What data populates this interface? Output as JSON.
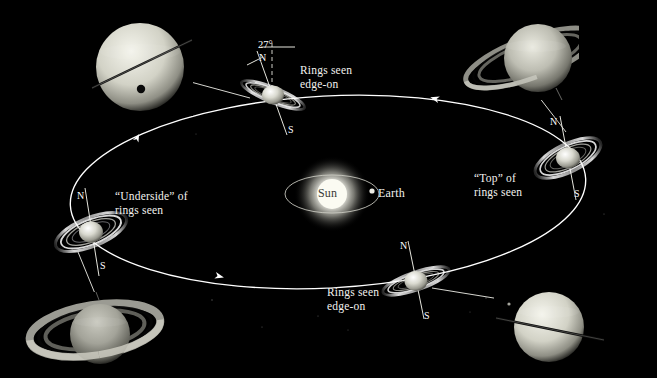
{
  "figure": {
    "background_color": "#000000",
    "line_color": "#f0f0ea",
    "text_color": "#f2f2ef",
    "width": 657,
    "height": 378
  },
  "center": {
    "sun_label": "Sun",
    "earth_label": "Earth",
    "sun_color": "#f5f5ef",
    "earth_color": "#e8e8e2"
  },
  "tilt": {
    "value": "27",
    "degree_symbol": "°",
    "display": "27°"
  },
  "orbit": {
    "direction_arrows": 3,
    "ellipse_color": "#ffffff"
  },
  "annotations": [
    {
      "id": "rings-edge-on-top",
      "text": "Rings seen\nedge-on",
      "x": 300,
      "y": 64
    },
    {
      "id": "top-of-rings",
      "text": "“Top” of\nrings seen",
      "x": 474,
      "y": 172
    },
    {
      "id": "underside-of-rings",
      "text": "“Underside” of\nrings seen",
      "x": 115,
      "y": 190
    },
    {
      "id": "rings-edge-on-bottom",
      "text": "Rings seen\nedge-on",
      "x": 327,
      "y": 286
    }
  ],
  "orbit_positions": [
    {
      "id": "saturn-top",
      "label_north": "N",
      "label_south": "S",
      "ring_state": "edge-on",
      "x": 273,
      "y": 95
    },
    {
      "id": "saturn-right",
      "label_north": "N",
      "label_south": "S",
      "ring_state": "top-seen",
      "x": 568,
      "y": 158
    },
    {
      "id": "saturn-bottom",
      "label_north": "N",
      "label_south": "S",
      "ring_state": "edge-on",
      "x": 416,
      "y": 281
    },
    {
      "id": "saturn-left",
      "label_north": "N",
      "label_south": "S",
      "ring_state": "underside-seen",
      "x": 91,
      "y": 232
    }
  ],
  "photographs": [
    {
      "id": "photo-top-left",
      "description": "Saturn with rings edge-on, thin dark ring line and moon shadow dot",
      "x": 88,
      "y": 18,
      "width": 105,
      "height": 98
    },
    {
      "id": "photo-top-right",
      "description": "Saturn with rings tilted showing top of ring plane",
      "x": 444,
      "y": 10,
      "width": 135,
      "height": 90
    },
    {
      "id": "photo-bottom-left",
      "description": "Saturn with rings widely open showing underside",
      "x": 22,
      "y": 292,
      "width": 145,
      "height": 72
    },
    {
      "id": "photo-bottom-right",
      "description": "Saturn with rings edge-on as a thin dark line",
      "x": 494,
      "y": 288,
      "width": 150,
      "height": 78
    }
  ]
}
